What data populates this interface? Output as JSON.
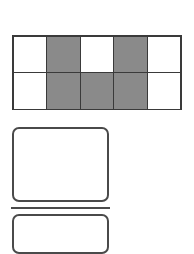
{
  "grid": {
    "rows": 2,
    "cols": 5,
    "cells": [
      [
        "white",
        "shaded",
        "white",
        "shaded",
        "white"
      ],
      [
        "white",
        "shaded",
        "shaded",
        "shaded",
        "white"
      ]
    ],
    "colors": {
      "shaded": "#8a8a8a",
      "white": "#ffffff",
      "border": "#3a3a3a"
    }
  },
  "shapes": [
    {
      "type": "rounded-rectangle",
      "label": ""
    },
    {
      "type": "horizontal-line"
    },
    {
      "type": "rounded-rectangle",
      "label": ""
    }
  ]
}
